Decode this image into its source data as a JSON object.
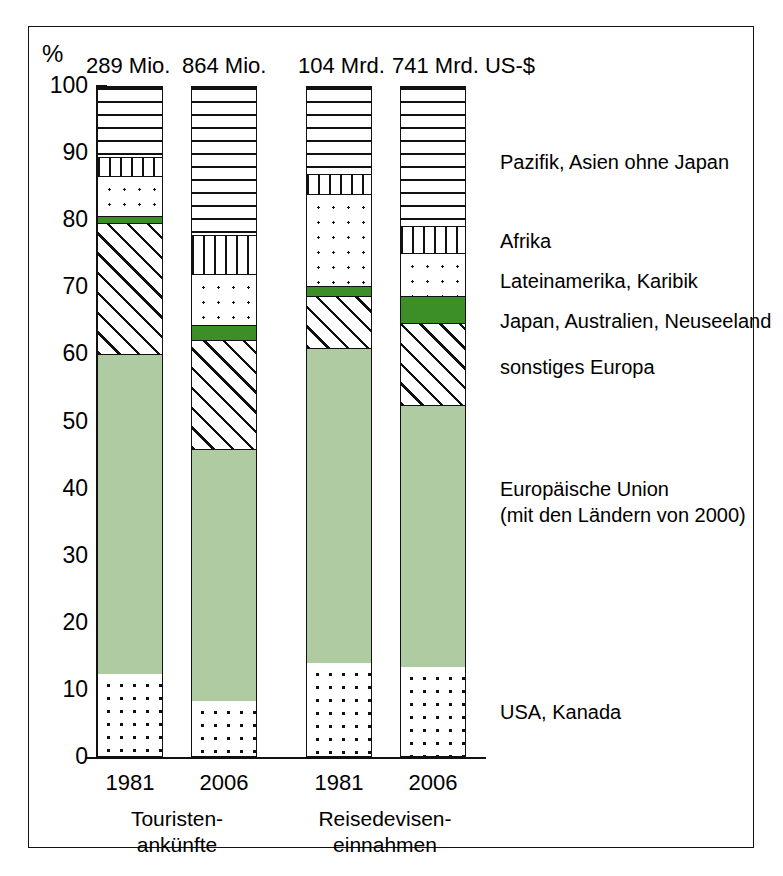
{
  "axis": {
    "unit_symbol": "%",
    "y_ticks": [
      "100",
      "90",
      "80",
      "70",
      "60",
      "50",
      "40",
      "30",
      "20",
      "10",
      "0"
    ],
    "y_min": 0,
    "y_max": 100
  },
  "bars": [
    {
      "id": "bar-1981-ankuenfte",
      "top_label": "289 Mio.",
      "year": "1981"
    },
    {
      "id": "bar-2006-ankuenfte",
      "top_label": "864 Mio.",
      "year": "2006"
    },
    {
      "id": "bar-1981-einnahmen",
      "top_label": "104 Mrd.",
      "year": "1981"
    },
    {
      "id": "bar-2006-einnahmen",
      "top_label": "741 Mrd. US-$",
      "year": "2006"
    }
  ],
  "groups": [
    {
      "id": "group-ankuenfte",
      "line1": "Touristen-",
      "line2": "ankünfte"
    },
    {
      "id": "group-einnahmen",
      "line1": "Reisedevisen-",
      "line2": "einnahmen"
    }
  ],
  "legend": [
    {
      "id": "legend-pazifik",
      "label": "Pazifik, Asien ohne Japan"
    },
    {
      "id": "legend-afrika",
      "label": "Afrika"
    },
    {
      "id": "legend-lateinamerika",
      "label": "Lateinamerika, Karibik"
    },
    {
      "id": "legend-japan",
      "label": "Japan, Australien, Neuseeland"
    },
    {
      "id": "legend-sonstiges-europa",
      "label": "sonstiges Europa"
    },
    {
      "id": "legend-eu-line1",
      "label": "Europäische Union"
    },
    {
      "id": "legend-eu-line2",
      "label": "(mit den Ländern von 2000)"
    },
    {
      "id": "legend-usa",
      "label": "USA, Kanada"
    }
  ],
  "colors": {
    "green_band": "#3c8f26",
    "eu_green": "#aecba2",
    "outline": "#111111",
    "background": "#ffffff"
  },
  "chart_data": {
    "type": "bar",
    "subtype": "stacked-100-percent",
    "title": "",
    "xlabel": "",
    "ylabel": "%",
    "ylim": [
      0,
      100
    ],
    "grid": false,
    "legend_position": "right",
    "categories": [
      "1981 Touristenankünfte",
      "2006 Touristenankünfte",
      "1981 Reisedeviseneinnahmen",
      "2006 Reisedeviseneinnahmen"
    ],
    "category_totals": [
      "289 Mio.",
      "864 Mio.",
      "104 Mrd.",
      "741 Mrd. US-$"
    ],
    "series": [
      {
        "name": "USA, Kanada",
        "pattern": "dots-dense",
        "values": [
          12.5,
          8.5,
          14.2,
          13.6
        ]
      },
      {
        "name": "Europäische Union (mit den Ländern von 2000)",
        "pattern": "solid-light-green",
        "values": [
          47.7,
          37.5,
          46.9,
          39.0
        ]
      },
      {
        "name": "sonstiges Europa",
        "pattern": "diagonal-hatch",
        "values": [
          19.6,
          16.3,
          7.8,
          12.2
        ]
      },
      {
        "name": "Japan, Australien, Neuseeland",
        "pattern": "solid-green",
        "values": [
          1.0,
          2.3,
          1.4,
          4.0
        ]
      },
      {
        "name": "Lateinamerika, Karibik",
        "pattern": "dots",
        "values": [
          6.0,
          7.6,
          13.7,
          6.5
        ]
      },
      {
        "name": "Afrika",
        "pattern": "vertical-stripes",
        "values": [
          2.7,
          5.8,
          3.0,
          4.0
        ]
      },
      {
        "name": "Pazifik, Asien ohne Japan",
        "pattern": "horizontal-stripes",
        "values": [
          10.5,
          22.0,
          13.0,
          20.7
        ]
      }
    ],
    "cumulative_tops": {
      "1981 Touristenankünfte": {
        "USA, Kanada": 12.5,
        "Europäische Union": 60.2,
        "sonstiges Europa": 79.8,
        "Japan, Australien, Neuseeland": 80.8,
        "Lateinamerika, Karibik": 86.8,
        "Afrika": 89.5,
        "Pazifik, Asien ohne Japan": 100
      },
      "2006 Touristenankünfte": {
        "USA, Kanada": 8.5,
        "Europäische Union": 46.0,
        "sonstiges Europa": 62.3,
        "Japan, Australien, Neuseeland": 64.6,
        "Lateinamerika, Karibik": 72.2,
        "Afrika": 78.0,
        "Pazifik, Asien ohne Japan": 100
      },
      "1981 Reisedeviseneinnahmen": {
        "USA, Kanada": 14.2,
        "Europäische Union": 61.1,
        "sonstiges Europa": 68.9,
        "Japan, Australien, Neuseeland": 70.3,
        "Lateinamerika, Karibik": 84.0,
        "Afrika": 87.0,
        "Pazifik, Asien ohne Japan": 100
      },
      "2006 Reisedeviseneinnahmen": {
        "USA, Kanada": 13.6,
        "Europäische Union": 52.6,
        "sonstiges Europa": 64.8,
        "Japan, Australien, Neuseeland": 68.8,
        "Lateinamerika, Karibik": 75.3,
        "Afrika": 79.3,
        "Pazifik, Asien ohne Japan": 100
      }
    }
  },
  "layout": {
    "plot_top_px": 86,
    "plot_bottom_px": 757,
    "bar_x_px": [
      97,
      191,
      306,
      400
    ],
    "bar_width_px": 66,
    "legend_y_px": [
      150,
      229,
      269,
      283,
      355,
      477,
      506,
      700
    ]
  }
}
